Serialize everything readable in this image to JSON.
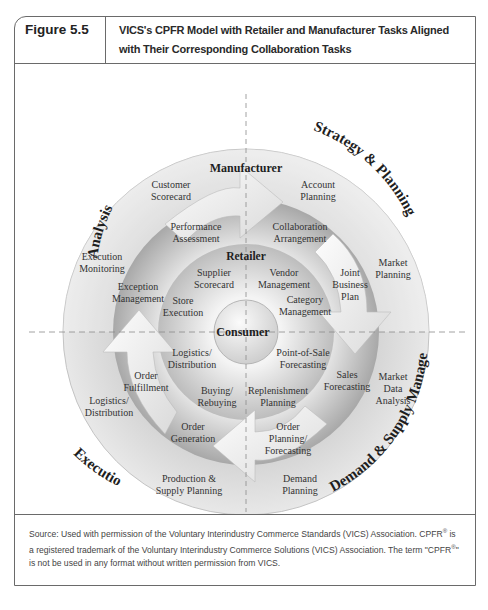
{
  "figure": {
    "label": "Figure 5.5",
    "title": "VICS's CPFR Model with Retailer and Manufacturer Tasks Aligned with Their Corresponding Collaboration Tasks"
  },
  "diagram": {
    "center": "Consumer",
    "rings": {
      "retailer": "Retailer",
      "manufacturer": "Manufacturer"
    },
    "quadrants": {
      "top_left": "Analysis",
      "top_right": "Strategy & Planning",
      "bottom_right": "Demand & Supply Management",
      "bottom_left": "Execution"
    },
    "outer_tasks": {
      "customer_scorecard": [
        "Customer",
        "Scorecard"
      ],
      "execution_monitoring": [
        "Execution",
        "Monitoring"
      ],
      "account_planning": [
        "Account",
        "Planning"
      ],
      "market_planning": [
        "Market",
        "Planning"
      ],
      "market_data_analysis": [
        "Market",
        "Data",
        "Analysis"
      ],
      "demand_planning": [
        "Demand",
        "Planning"
      ],
      "production_supply_planning": [
        "Production &",
        "Supply Planning"
      ],
      "logistics_distribution_outer": [
        "Logistics/",
        "Distribution"
      ]
    },
    "collaboration_tasks": {
      "performance_assessment": [
        "Performance",
        "Assessment"
      ],
      "exception_management": [
        "Exception",
        "Management"
      ],
      "collaboration_arrangement": [
        "Collaboration",
        "Arrangement"
      ],
      "joint_business_plan": [
        "Joint",
        "Business",
        "Plan"
      ],
      "sales_forecasting": [
        "Sales",
        "Forecasting"
      ],
      "order_planning_forecasting": [
        "Order",
        "Planning/",
        "Forecasting"
      ],
      "order_generation": [
        "Order",
        "Generation"
      ],
      "order_fulfillment": [
        "Order",
        "Fulfillment"
      ]
    },
    "inner_tasks": {
      "supplier_scorecard": [
        "Supplier",
        "Scorecard"
      ],
      "store_execution": [
        "Store",
        "Execution"
      ],
      "vendor_management": [
        "Vendor",
        "Management"
      ],
      "category_management": [
        "Category",
        "Management"
      ],
      "pos_forecasting": [
        "Point-of-Sale",
        "Forecasting"
      ],
      "replenishment_planning": [
        "Replenishment",
        "Planning"
      ],
      "buying_rebuying": [
        "Buying/",
        "Rebuying"
      ],
      "logistics_distribution_inner": [
        "Logistics/",
        "Distribution"
      ]
    }
  },
  "source": {
    "text_1": "Source: Used with permission of the Voluntary Interindustry Commerce Standards (VICS) Association. CPFR",
    "reg": "®",
    "text_2": " is a registered trademark of the Voluntary Interindustry Commerce Solutions (VICS) Association. The term \"CPFR",
    "text_3": "\" is not be used in any format without written permission from VICS."
  }
}
